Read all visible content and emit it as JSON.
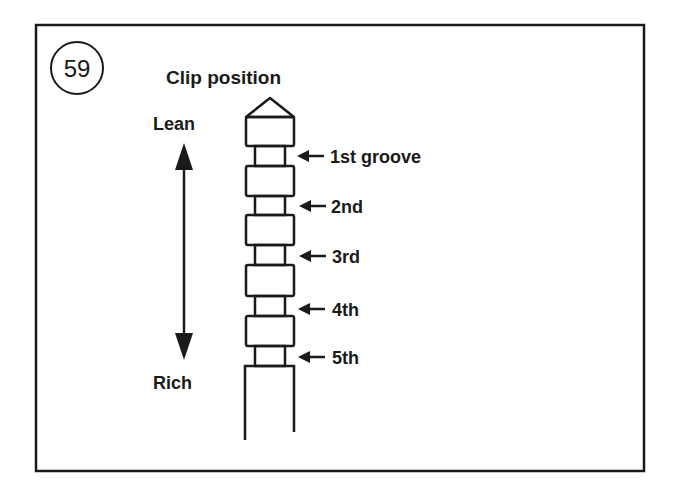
{
  "figure": {
    "number": "59",
    "title": "Clip position",
    "direction": {
      "top_label": "Lean",
      "bottom_label": "Rich"
    },
    "grooves": [
      {
        "label": "1st groove"
      },
      {
        "label": "2nd"
      },
      {
        "label": "3rd"
      },
      {
        "label": "4th"
      },
      {
        "label": "5th"
      }
    ]
  },
  "colors": {
    "ink": "#1a1a1a",
    "background": "#ffffff"
  }
}
